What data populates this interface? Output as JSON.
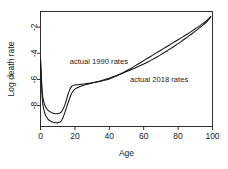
{
  "chart_data": {
    "type": "line",
    "title": "",
    "subtitle": "",
    "xlabel": "Age",
    "ylabel": "Log death rate",
    "xlim": [
      0,
      100
    ],
    "ylim": [
      -9.6,
      -0.8
    ],
    "grid": false,
    "legend_position": "inline-annotations",
    "xticks": [
      "0",
      "20",
      "40",
      "60",
      "80",
      "100"
    ],
    "xtick_values": [
      0,
      20,
      40,
      60,
      80,
      100
    ],
    "yticks": [
      "-2",
      "-4",
      "-6",
      "-8"
    ],
    "ytick_values": [
      -2,
      -4,
      -6,
      -8
    ],
    "annotations": [
      {
        "label": "actual 1990 rates",
        "x": 17,
        "y": -4.85
      },
      {
        "label": "actual 2018 rates",
        "x": 52,
        "y": -6.2
      }
    ],
    "series": [
      {
        "name": "actual 1990 rates",
        "x": [
          0,
          1,
          2,
          3,
          4,
          5,
          6,
          7,
          8,
          9,
          10,
          11,
          12,
          13,
          14,
          15,
          16,
          17,
          18,
          19,
          20,
          22,
          25,
          28,
          30,
          33,
          35,
          38,
          40,
          43,
          45,
          48,
          50,
          53,
          55,
          58,
          60,
          63,
          65,
          68,
          70,
          73,
          75,
          78,
          80,
          83,
          85,
          88,
          90,
          93,
          95,
          97,
          99
        ],
        "values": [
          -4.45,
          -6.95,
          -7.75,
          -8.1,
          -8.3,
          -8.42,
          -8.5,
          -8.56,
          -8.6,
          -8.62,
          -8.62,
          -8.58,
          -8.5,
          -8.3,
          -8.0,
          -7.6,
          -7.15,
          -6.8,
          -6.55,
          -6.45,
          -6.42,
          -6.4,
          -6.35,
          -6.3,
          -6.26,
          -6.2,
          -6.14,
          -6.04,
          -5.96,
          -5.8,
          -5.68,
          -5.48,
          -5.34,
          -5.12,
          -4.96,
          -4.72,
          -4.56,
          -4.32,
          -4.16,
          -3.92,
          -3.76,
          -3.52,
          -3.36,
          -3.12,
          -2.96,
          -2.72,
          -2.56,
          -2.3,
          -2.12,
          -1.86,
          -1.66,
          -1.45,
          -1.18
        ]
      },
      {
        "name": "actual 2018 rates",
        "x": [
          0,
          1,
          2,
          3,
          4,
          5,
          6,
          7,
          8,
          9,
          10,
          11,
          12,
          13,
          14,
          15,
          16,
          17,
          18,
          19,
          20,
          22,
          25,
          28,
          30,
          33,
          35,
          38,
          40,
          43,
          45,
          48,
          50,
          53,
          55,
          58,
          60,
          63,
          65,
          68,
          70,
          73,
          75,
          78,
          80,
          83,
          85,
          88,
          90,
          93,
          95,
          97,
          99
        ],
        "values": [
          -4.45,
          -7.45,
          -8.35,
          -8.75,
          -8.98,
          -9.12,
          -9.2,
          -9.26,
          -9.3,
          -9.32,
          -9.32,
          -9.28,
          -9.18,
          -8.95,
          -8.6,
          -8.2,
          -7.8,
          -7.42,
          -7.1,
          -6.88,
          -6.74,
          -6.6,
          -6.45,
          -6.34,
          -6.28,
          -6.18,
          -6.1,
          -5.98,
          -5.9,
          -5.76,
          -5.66,
          -5.5,
          -5.4,
          -5.24,
          -5.12,
          -4.94,
          -4.82,
          -4.62,
          -4.48,
          -4.26,
          -4.1,
          -3.86,
          -3.7,
          -3.44,
          -3.26,
          -2.98,
          -2.8,
          -2.5,
          -2.3,
          -2.0,
          -1.78,
          -1.55,
          -1.22
        ]
      }
    ]
  },
  "colors": {
    "series_stroke": "#141414",
    "axis": "#1a1a1a",
    "background": "#ffffff"
  }
}
